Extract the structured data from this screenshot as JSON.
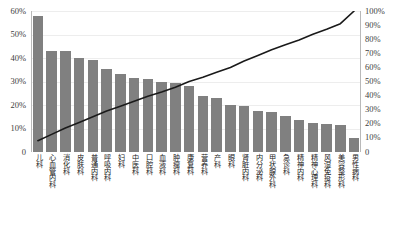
{
  "chart_data": {
    "type": "bar",
    "chart_style": "pareto",
    "title": "",
    "subtitle": "",
    "xlabel": "",
    "ylabel": "",
    "grid": true,
    "legend": null,
    "categories": [
      "儿科",
      "心血管内科",
      "消化科",
      "皮肤科",
      "普通内科",
      "呼吸内科",
      "妇科",
      "中医科",
      "口腔科",
      "血液科",
      "肿瘤科",
      "康复科",
      "营养科",
      "产科",
      "眼科",
      "肾脏内科",
      "内分泌科",
      "甲状腺外科",
      "急诊科",
      "精神内科",
      "精神心理科",
      "风湿免疫科",
      "美容整形科",
      "男性病科"
    ],
    "series": [
      {
        "name": "占比",
        "type": "bar",
        "axis": "left",
        "color": "#808080",
        "values": [
          58,
          43,
          43,
          40,
          39,
          35.5,
          33,
          31.5,
          31,
          30,
          29.5,
          28,
          24,
          23,
          20,
          19.5,
          17.5,
          17,
          15.5,
          13.5,
          12.5,
          12,
          11.5,
          6
        ]
      },
      {
        "name": "累计百分比",
        "type": "line",
        "axis": "right",
        "color": "#1a1a1a",
        "values": [
          8,
          12.5,
          17,
          21,
          25,
          29,
          32.5,
          36,
          39.5,
          42.5,
          46,
          50,
          53,
          56.5,
          60,
          64.5,
          68.5,
          72.5,
          76,
          79.5,
          83.5,
          87,
          91,
          100
        ]
      }
    ],
    "left_axis": {
      "min": 0,
      "max": 60,
      "step": 10,
      "ticks": [
        "0",
        "10%",
        "20%",
        "30%",
        "40%",
        "50%",
        "60%"
      ]
    },
    "right_axis": {
      "min": 0,
      "max": 100,
      "step": 10,
      "ticks": [
        "0",
        "10%",
        "20%",
        "30%",
        "40%",
        "50%",
        "60%",
        "70%",
        "80%",
        "90%",
        "100%"
      ]
    }
  }
}
